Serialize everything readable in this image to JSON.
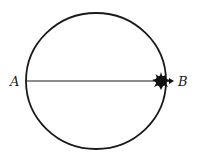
{
  "diagram": {
    "type": "circle-with-diameter",
    "labels": {
      "point_a": "A",
      "point_b": "B"
    },
    "colors": {
      "stroke": "#1a1a1a",
      "background": "#ffffff"
    }
  }
}
